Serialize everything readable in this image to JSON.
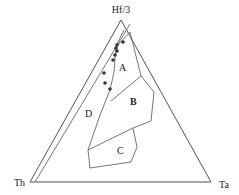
{
  "diagram": {
    "type": "ternary",
    "vertices": {
      "top": "Hf/3",
      "left": "Th",
      "right": "Ta"
    },
    "fields": [
      {
        "label": "A"
      },
      {
        "label": "B"
      },
      {
        "label": "C"
      },
      {
        "label": "D"
      }
    ],
    "colors": {
      "lines": "#555555",
      "points": "#333333",
      "background": "#ffffff"
    },
    "data_points_count": 9
  }
}
